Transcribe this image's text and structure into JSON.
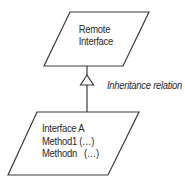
{
  "diagram": {
    "type": "uml-inheritance",
    "colors": {
      "stroke": "#3a3a3a",
      "text": "#2a2a2a",
      "background": "#ffffff"
    },
    "parent": {
      "shape": "parallelogram",
      "lines": [
        "Remote",
        "Interface"
      ]
    },
    "relation": {
      "label": "Inheritance relation",
      "arrowhead": "hollow-triangle"
    },
    "child": {
      "shape": "parallelogram",
      "lines": [
        "Interface A",
        "Method1 (…)",
        "Methodn   (…)"
      ]
    }
  }
}
